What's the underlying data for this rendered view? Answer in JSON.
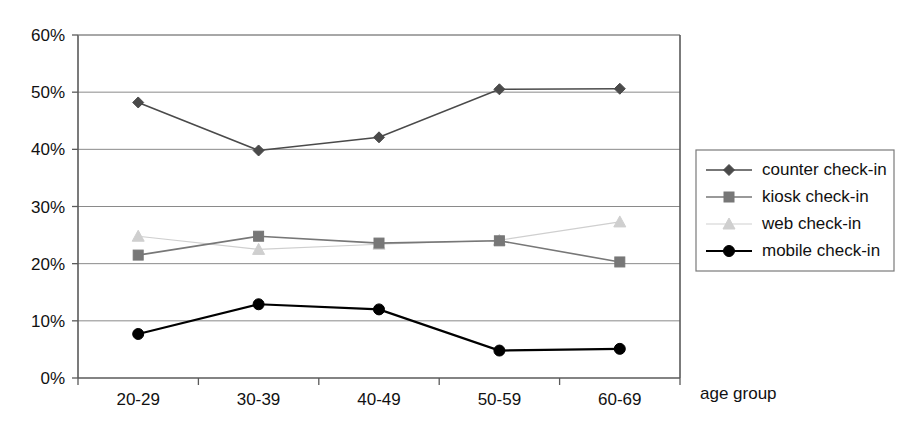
{
  "chart_data": {
    "type": "line",
    "title": "",
    "xlabel": "age group",
    "ylabel": "",
    "categories": [
      "20-29",
      "30-39",
      "40-49",
      "50-59",
      "60-69"
    ],
    "ylim": [
      0,
      60
    ],
    "ytick_labels": [
      "0%",
      "10%",
      "20%",
      "30%",
      "40%",
      "50%",
      "60%"
    ],
    "ytick_values": [
      0,
      10,
      20,
      30,
      40,
      50,
      60
    ],
    "grid": true,
    "legend_position": "right",
    "series": [
      {
        "name": "counter check-in",
        "marker": "diamond",
        "color": "#4a4a4a",
        "values": [
          48.2,
          39.8,
          42.1,
          50.5,
          50.6
        ]
      },
      {
        "name": "kiosk check-in",
        "marker": "square",
        "color": "#777777",
        "values": [
          21.5,
          24.8,
          23.6,
          24.0,
          20.3
        ]
      },
      {
        "name": "web check-in",
        "marker": "triangle",
        "color": "#cfcfcf",
        "values": [
          24.8,
          22.5,
          23.4,
          24.1,
          27.3
        ]
      },
      {
        "name": "mobile check-in",
        "marker": "circle",
        "color": "#000000",
        "values": [
          7.7,
          12.9,
          12.0,
          4.8,
          5.1
        ]
      }
    ]
  },
  "legend": {
    "items": [
      {
        "label": "counter check-in"
      },
      {
        "label": "kiosk check-in"
      },
      {
        "label": "web check-in"
      },
      {
        "label": "mobile check-in"
      }
    ]
  },
  "axes": {
    "x_title": "age group"
  },
  "colors": {
    "counter": "#4a4a4a",
    "kiosk": "#777777",
    "web": "#cfcfcf",
    "mobile": "#000000",
    "grid": "#8a8a8a",
    "axis": "#5a5a5a",
    "background": "#ffffff"
  }
}
